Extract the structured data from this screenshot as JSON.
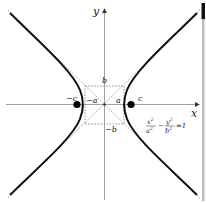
{
  "diagram": {
    "axes": {
      "x_label": "x",
      "y_label": "y"
    },
    "labels": {
      "b_pos": "b",
      "b_neg": "−b",
      "a_pos": "a",
      "a_neg": "−a",
      "c_pos": "c",
      "c_neg": "−c"
    },
    "equation": {
      "x_num": "x",
      "x_num_exp": "2",
      "x_den": "a",
      "x_den_exp": "2",
      "minus": "−",
      "y_num": "y",
      "y_num_exp": "2",
      "y_den": "b",
      "y_den_exp": "2",
      "equals": "=1"
    },
    "colors": {
      "curve": "#111111",
      "axis": "#777777",
      "dashed": "#666666",
      "foci": "#000000",
      "side_bar": "#bbbbbb",
      "side_bar_top": "#111111"
    }
  }
}
